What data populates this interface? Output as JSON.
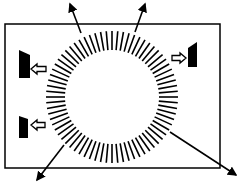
{
  "diagram": {
    "title": "",
    "colors": {
      "stroke": "#000000",
      "fill": "#000000",
      "background": "#ffffff",
      "hollow": "#ffffff"
    },
    "frame": {
      "x": 5,
      "y": 24,
      "width": 215,
      "height": 144
    },
    "ring": {
      "cx": 112,
      "cy": 97,
      "inner_radius": 47,
      "outer_radius": 66,
      "tick_count": 72,
      "tick_width": 1.6
    },
    "outgoing_arrows": [
      {
        "name": "arrow-up-left",
        "from": [
          81,
          33
        ],
        "to": [
          70,
          4
        ]
      },
      {
        "name": "arrow-up-right",
        "from": [
          135,
          32
        ],
        "to": [
          145,
          4
        ]
      },
      {
        "name": "arrow-down-left",
        "from": [
          64,
          145
        ],
        "to": [
          37,
          180
        ]
      },
      {
        "name": "arrow-down-right",
        "from": [
          170,
          132
        ],
        "to": [
          236,
          175
        ]
      }
    ],
    "plates": [
      {
        "name": "plate-left-top",
        "points": [
          [
            19,
            50
          ],
          [
            30,
            55
          ],
          [
            30,
            78
          ],
          [
            19,
            78
          ]
        ]
      },
      {
        "name": "plate-left-bottom",
        "points": [
          [
            19,
            116
          ],
          [
            28,
            119
          ],
          [
            28,
            138
          ],
          [
            19,
            138
          ]
        ]
      },
      {
        "name": "plate-right",
        "points": [
          [
            188,
            48
          ],
          [
            197,
            42
          ],
          [
            197,
            67
          ],
          [
            188,
            67
          ]
        ]
      }
    ],
    "hollow_arrows": [
      {
        "name": "hollow-arrow-left-top",
        "tip": [
          31,
          69
        ],
        "direction": "left",
        "length": 15
      },
      {
        "name": "hollow-arrow-left-bottom",
        "tip": [
          31,
          125
        ],
        "direction": "left",
        "length": 14
      },
      {
        "name": "hollow-arrow-right",
        "tip": [
          186,
          58
        ],
        "direction": "right",
        "length": 14
      }
    ]
  }
}
